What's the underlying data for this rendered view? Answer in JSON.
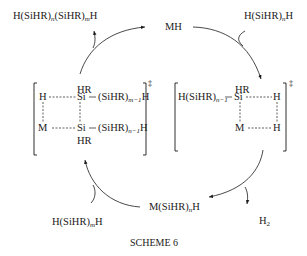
{
  "scheme": {
    "caption": "SCHEME 6",
    "top_left_product": {
      "prefix": "H(SiHR)",
      "sub1": "n",
      "mid": "(SiHR)",
      "sub2": "m",
      "suffix": "H"
    },
    "top_reagent_mh": "MH",
    "top_right_reactant": {
      "prefix": "H(SiHR)",
      "sub": "n",
      "suffix": "H"
    },
    "bottom_left_reactant": {
      "prefix": "H(SiHR)",
      "sub": "m",
      "suffix": "H"
    },
    "bottom_intermediate": {
      "prefix": "M(SiHR)",
      "sub": "n",
      "suffix": "H"
    },
    "byproduct": {
      "prefix": "H",
      "sub": "2"
    },
    "left_transition_state": {
      "hr_top": "HR",
      "hr_bottom": "HR",
      "h_atom": "H",
      "m_atom": "M",
      "si_top": "Si",
      "si_bottom": "Si",
      "chain_top": {
        "prefix": "(SiHR)",
        "sub": "m−1",
        "suffix": "H"
      },
      "chain_bottom": {
        "prefix": "(SiHR)",
        "sub": "n−1",
        "suffix": "H"
      },
      "dagger": "‡"
    },
    "right_transition_state": {
      "hr_top": "HR",
      "chain": {
        "prefix": "H(SiHR)",
        "sub": "n−1"
      },
      "si": "Si",
      "h_top": "H",
      "m_atom": "M",
      "h_bottom": "H",
      "dagger": "‡"
    }
  }
}
